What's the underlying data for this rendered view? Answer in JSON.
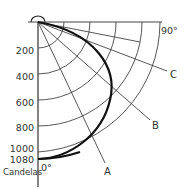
{
  "diagram": {
    "type": "polar-candela-distribution",
    "axis_unit_label": "Candelas",
    "angle_labels": {
      "start": "0°",
      "end": "90°"
    },
    "radial_ticks": [
      "200",
      "400",
      "600",
      "800",
      "1000",
      "1080"
    ],
    "ray_labels": [
      "A",
      "B",
      "C"
    ],
    "colors": {
      "line": "#333333",
      "curve": "#111111",
      "background": "#ffffff"
    }
  }
}
